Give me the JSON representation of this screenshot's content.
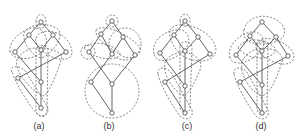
{
  "figure": {
    "panels": [
      {
        "label": "(a)",
        "label_pos": [
          39,
          129
        ],
        "nodes": [
          [
            41,
            22
          ],
          [
            29,
            35
          ],
          [
            53,
            35
          ],
          [
            15,
            52
          ],
          [
            41,
            50
          ],
          [
            66,
            52
          ],
          [
            18,
            78
          ],
          [
            41,
            82
          ],
          [
            41,
            108
          ]
        ],
        "edges": [
          [
            0,
            1
          ],
          [
            0,
            2
          ],
          [
            1,
            3
          ],
          [
            1,
            4
          ],
          [
            2,
            4
          ],
          [
            2,
            5
          ],
          [
            3,
            7
          ],
          [
            4,
            7
          ],
          [
            5,
            6
          ],
          [
            6,
            8
          ],
          [
            7,
            8
          ]
        ],
        "hulls": [
          "M36,22 C36,12 46,12 46,22 C46,30 36,30 36,22 Z",
          "M10,52 C8,40 24,28 35,28 C44,28 50,40 44,50 C36,60 14,62 10,52 Z",
          "M24,33 C28,22 58,22 60,33 C62,40 50,56 41,58 C32,56 22,42 24,33 Z",
          "M36,38 C40,26 70,30 72,52 C72,62 58,60 50,56 C44,52 34,46 36,38 Z",
          "M12,72 C8,66 20,64 26,72 L47,106 C50,112 46,118 40,116 C32,112 14,80 12,72 Z",
          "M36,50 C36,44 48,44 48,50 L47,110 C47,118 36,118 36,110 Z",
          "M18,58 C30,40 60,50 62,56 C60,66 50,92 44,96 C34,94 10,68 18,58 Z"
        ]
      },
      {
        "label": "(b)",
        "label_pos": [
          109,
          129
        ],
        "nodes": [
          [
            112,
            21
          ],
          [
            101,
            34
          ],
          [
            123,
            37
          ],
          [
            89,
            52
          ],
          [
            112,
            54
          ],
          [
            135,
            55
          ],
          [
            91,
            82
          ],
          [
            112,
            84
          ],
          [
            112,
            113
          ]
        ],
        "edges": [
          [
            0,
            1
          ],
          [
            0,
            2
          ],
          [
            1,
            3
          ],
          [
            1,
            4
          ],
          [
            2,
            4
          ],
          [
            2,
            5
          ],
          [
            3,
            7
          ],
          [
            4,
            6
          ],
          [
            5,
            7
          ],
          [
            6,
            8
          ],
          [
            7,
            8
          ]
        ],
        "circles": [
          [
            112,
            21,
            6
          ],
          [
            88,
            52,
            7
          ],
          [
            125,
            44,
            16
          ],
          [
            112,
            91,
            27
          ]
        ],
        "hulls": [
          "M96,30 C104,22 132,36 140,48 C142,56 130,60 122,56 C114,50 94,40 96,30 Z",
          "M84,48 C94,38 118,46 120,54 C118,62 94,60 84,48 Z"
        ]
      },
      {
        "label": "(c)",
        "label_pos": [
          187,
          129
        ],
        "nodes": [
          [
            185,
            21
          ],
          [
            174,
            35
          ],
          [
            198,
            37
          ],
          [
            160,
            53
          ],
          [
            185,
            51
          ],
          [
            210,
            54
          ],
          [
            165,
            82
          ],
          [
            185,
            86
          ],
          [
            185,
            113
          ]
        ],
        "edges": [
          [
            0,
            1
          ],
          [
            0,
            2
          ],
          [
            1,
            3
          ],
          [
            1,
            4
          ],
          [
            2,
            4
          ],
          [
            2,
            5
          ],
          [
            3,
            7
          ],
          [
            4,
            7
          ],
          [
            5,
            6
          ],
          [
            6,
            8
          ],
          [
            7,
            8
          ]
        ],
        "hulls": [
          "M180,21 C180,12 190,12 190,21 C190,28 180,28 180,21 Z",
          "M154,54 C150,38 170,28 182,30 C192,34 190,46 182,52 C172,62 156,64 154,54 Z",
          "M170,30 C176,18 214,28 216,50 C214,64 196,62 186,58 C176,52 168,40 170,30 Z",
          "M158,74 C156,66 168,66 172,74 L192,110 C194,118 186,122 180,116 C172,106 160,84 158,74 Z",
          "M180,46 C180,40 192,40 192,48 L190,108 C190,114 180,114 180,106 Z",
          "M166,60 C180,44 206,56 200,70 C194,84 190,92 184,96 C174,92 160,72 166,60 Z"
        ]
      },
      {
        "label": "(d)",
        "label_pos": [
          261,
          129
        ],
        "nodes": [
          [
            262,
            22
          ],
          [
            250,
            36
          ],
          [
            276,
            37
          ],
          [
            236,
            55
          ],
          [
            262,
            51
          ],
          [
            288,
            56
          ],
          [
            240,
            82
          ],
          [
            262,
            85
          ],
          [
            262,
            113
          ]
        ],
        "edges": [
          [
            0,
            1
          ],
          [
            0,
            2
          ],
          [
            1,
            3
          ],
          [
            1,
            4
          ],
          [
            2,
            4
          ],
          [
            2,
            5
          ],
          [
            3,
            7
          ],
          [
            4,
            7
          ],
          [
            5,
            6
          ],
          [
            6,
            8
          ],
          [
            7,
            8
          ]
        ],
        "hulls": [
          "M244,30 C248,12 276,12 284,28 C288,40 272,44 262,44 C250,44 242,40 244,30 Z",
          "M230,58 C226,44 244,30 256,32 C266,36 266,48 258,54 C248,64 232,66 230,58 Z",
          "M256,44 C262,32 292,42 294,56 C294,66 280,66 270,60 C262,56 254,50 256,44 Z",
          "M234,74 C232,66 244,66 248,74 L268,110 C270,118 262,122 256,116 C248,106 236,84 234,74 Z",
          "M257,46 C257,40 268,40 268,48 L267,108 C267,116 257,116 257,108 Z",
          "M244,58 C258,40 286,50 282,62 C276,80 270,94 262,96 C250,92 236,70 244,58 Z",
          "M238,48 C244,36 270,38 276,50 C274,58 252,64 238,48 Z"
        ]
      }
    ]
  }
}
